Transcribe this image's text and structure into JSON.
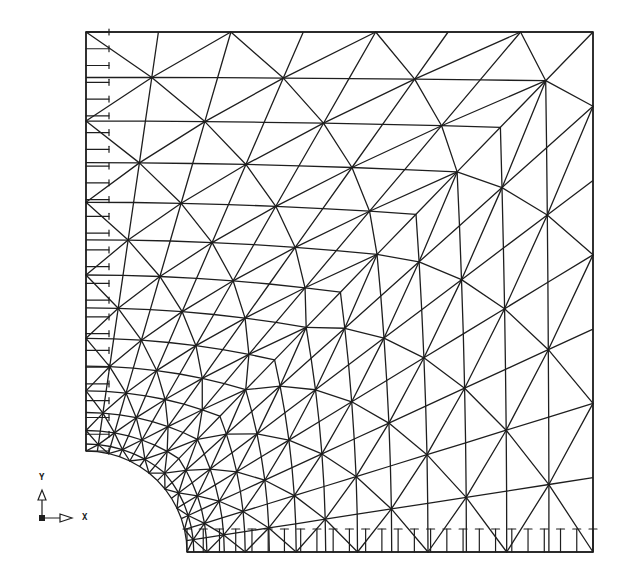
{
  "figure": {
    "type": "finite-element-mesh"
  },
  "geometry": {
    "plate_left": 86,
    "plate_top": 32,
    "plate_right": 593,
    "plate_bottom": 552,
    "hole_center": [
      86,
      552
    ],
    "hole_radius": 101
  },
  "mesh": {
    "radial_divisions": 14,
    "circumferential_divisions": 14,
    "line_color": "#1e1e1e",
    "line_width": 1.3
  },
  "supports": {
    "left_edge": {
      "direction": "x-fixed",
      "count": 26
    },
    "bottom_edge": {
      "direction": "y-fixed",
      "count": 26
    },
    "tick_length": 23
  },
  "axes": {
    "y_label": "Y",
    "x_label": "X",
    "origin": [
      42,
      518
    ]
  },
  "colors": {
    "background": "#ffffff",
    "ink": "#1e1e1e"
  }
}
